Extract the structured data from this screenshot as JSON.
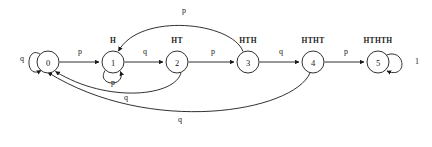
{
  "diagram": {
    "type": "finite-state-machine",
    "title": "",
    "background_color": "#ffffff",
    "stroke_color": "#1a1a1a",
    "nodes": [
      {
        "id": "n0",
        "label": "0",
        "caption": "",
        "cx": 48,
        "cy": 62,
        "r": 11
      },
      {
        "id": "n1",
        "label": "1",
        "caption": "H",
        "cx": 113,
        "cy": 62,
        "r": 11
      },
      {
        "id": "n2",
        "label": "2",
        "caption": "HT",
        "cx": 177,
        "cy": 62,
        "r": 11
      },
      {
        "id": "n3",
        "label": "3",
        "caption": "HTH",
        "cx": 248,
        "cy": 62,
        "r": 11
      },
      {
        "id": "n4",
        "label": "4",
        "caption": "HTHT",
        "cx": 313,
        "cy": 62,
        "r": 11
      },
      {
        "id": "n5",
        "label": "5",
        "caption": "HTHTH",
        "cx": 378,
        "cy": 62,
        "r": 11
      }
    ],
    "edges": [
      {
        "id": "e01",
        "from": "0",
        "to": "1",
        "label": "p",
        "label_x": 80,
        "label_y": 53
      },
      {
        "id": "e12",
        "from": "1",
        "to": "2",
        "label": "q",
        "label_x": 145,
        "label_y": 53
      },
      {
        "id": "e23",
        "from": "2",
        "to": "3",
        "label": "p",
        "label_x": 213,
        "label_y": 53
      },
      {
        "id": "e34",
        "from": "3",
        "to": "4",
        "label": "q",
        "label_x": 281,
        "label_y": 53
      },
      {
        "id": "e45",
        "from": "4",
        "to": "5",
        "label": "p",
        "label_x": 346,
        "label_y": 53
      },
      {
        "id": "e31",
        "from": "3",
        "to": "1",
        "label": "p",
        "label_x": 184,
        "label_y": 12
      },
      {
        "id": "e20",
        "from": "2",
        "to": "0",
        "label": "q",
        "label_x": 122,
        "label_y": 101
      },
      {
        "id": "e40",
        "from": "4",
        "to": "0",
        "label": "q",
        "label_x": 180,
        "label_y": 122
      }
    ],
    "self_loops": [
      {
        "id": "l0",
        "node": "0",
        "label": "q",
        "label_x": 22,
        "label_y": 61,
        "position": "left"
      },
      {
        "id": "l1",
        "node": "1",
        "label": "p",
        "label_x": 113,
        "label_y": 86,
        "position": "bottom"
      },
      {
        "id": "l5",
        "node": "5",
        "label": "1",
        "label_x": 417,
        "label_y": 64,
        "position": "right"
      }
    ]
  }
}
